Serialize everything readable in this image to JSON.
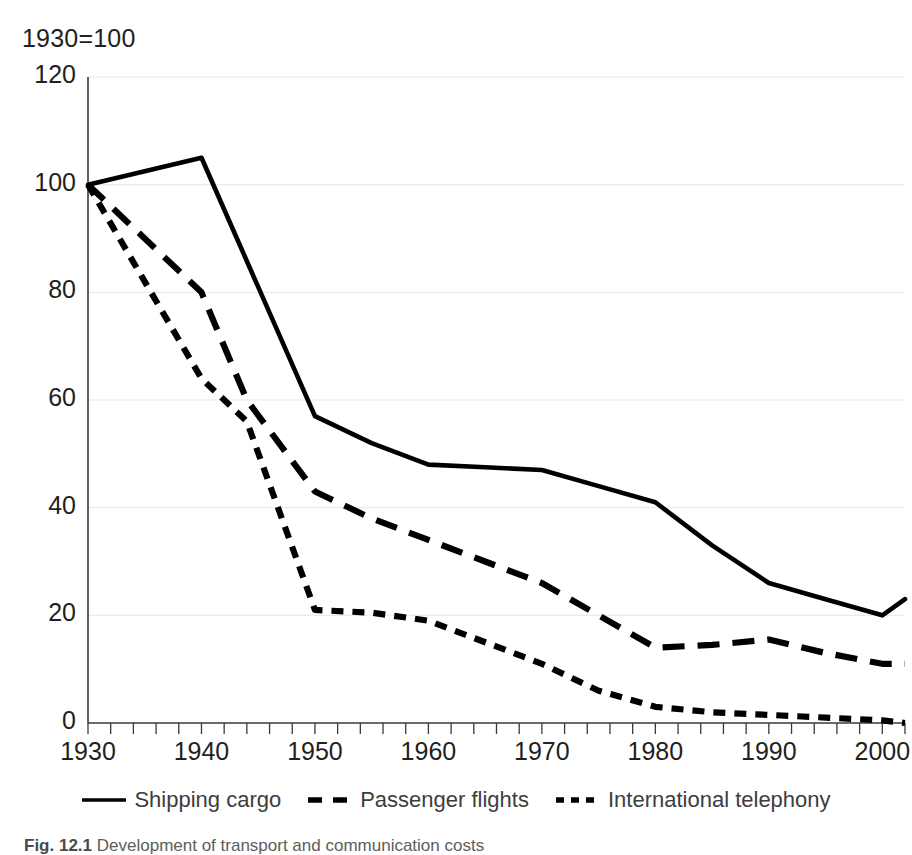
{
  "chart_data": {
    "type": "line",
    "title": "1930=100",
    "xlabel": "",
    "ylabel": "",
    "xlim": [
      1930,
      2002
    ],
    "ylim": [
      0,
      120
    ],
    "yticks": [
      0,
      20,
      40,
      60,
      80,
      100,
      120
    ],
    "xticks": [
      1930,
      1940,
      1950,
      1960,
      1970,
      1980,
      1990,
      2000
    ],
    "grid": true,
    "legend_position": "bottom",
    "minor_tick_interval": 2,
    "series": [
      {
        "name": "Shipping cargo",
        "style": "solid",
        "color": "#000000",
        "x": [
          1930,
          1940,
          1950,
          1955,
          1960,
          1965,
          1970,
          1975,
          1980,
          1985,
          1990,
          1995,
          2000,
          2002
        ],
        "values": [
          100,
          105,
          57,
          52,
          48,
          47.5,
          47,
          44,
          41,
          33,
          26,
          23,
          20,
          23
        ]
      },
      {
        "name": "Passenger flights",
        "style": "dashed-long",
        "color": "#000000",
        "x": [
          1930,
          1935,
          1940,
          1944,
          1950,
          1955,
          1960,
          1965,
          1970,
          1975,
          1980,
          1985,
          1990,
          1995,
          2000,
          2002
        ],
        "values": [
          100,
          90,
          80,
          60,
          43,
          38,
          34,
          30,
          26,
          20,
          14,
          14.5,
          15.5,
          13,
          11,
          11
        ]
      },
      {
        "name": "International telephony",
        "style": "dashed-short",
        "color": "#000000",
        "x": [
          1930,
          1935,
          1940,
          1944,
          1950,
          1955,
          1960,
          1965,
          1970,
          1975,
          1980,
          1985,
          1990,
          1995,
          2000,
          2002
        ],
        "values": [
          100,
          82,
          64,
          56,
          21,
          20.5,
          19,
          15,
          11,
          6,
          3,
          2,
          1.5,
          1,
          0.5,
          0
        ]
      }
    ],
    "ytick_labels": [
      "0",
      "20",
      "40",
      "60",
      "80",
      "100",
      "120"
    ],
    "xtick_labels": [
      "1930",
      "1940",
      "1950",
      "1960",
      "1970",
      "1980",
      "1990",
      "2000"
    ]
  },
  "legend": {
    "items": [
      {
        "label": "Shipping cargo",
        "marker": "solid-line-marker"
      },
      {
        "label": "Passenger flights",
        "marker": "long-dash-line-marker"
      },
      {
        "label": "International telephony",
        "marker": "short-dash-line-marker"
      }
    ]
  },
  "caption": {
    "figure_number": "Fig. 12.1",
    "text": "Development of transport and communication costs"
  }
}
